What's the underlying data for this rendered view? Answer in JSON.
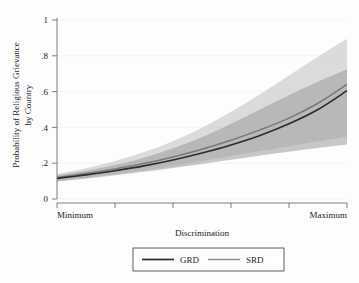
{
  "chart_data": {
    "type": "line",
    "title": "",
    "xlabel": "Discrimination",
    "ylabel": "Probability of Religious Grievance by Country",
    "ylim": [
      0,
      1
    ],
    "xlim": [
      0,
      1
    ],
    "grid": true,
    "y_ticks": [
      "0",
      ".2",
      ".4",
      ".6",
      ".8",
      "1"
    ],
    "y_tick_values": [
      0,
      0.2,
      0.4,
      0.6,
      0.8,
      1
    ],
    "x_ticks": [
      "Minimum",
      "",
      "",
      "",
      "",
      "Maximum"
    ],
    "x_tick_values": [
      0,
      0.2,
      0.4,
      0.6,
      0.8,
      1
    ],
    "legend_position": "below-axis",
    "x": [
      0,
      0.1,
      0.2,
      0.3,
      0.4,
      0.5,
      0.6,
      0.7,
      0.8,
      0.9,
      1
    ],
    "series": [
      {
        "name": "GRD",
        "color": "#2b2b2b",
        "values": [
          0.115,
          0.135,
          0.158,
          0.185,
          0.218,
          0.257,
          0.302,
          0.355,
          0.42,
          0.5,
          0.605
        ],
        "band_lower": [
          0.098,
          0.115,
          0.133,
          0.152,
          0.173,
          0.196,
          0.219,
          0.243,
          0.264,
          0.285,
          0.305
        ],
        "band_upper": [
          0.133,
          0.158,
          0.19,
          0.231,
          0.283,
          0.345,
          0.42,
          0.5,
          0.58,
          0.655,
          0.725
        ],
        "band_color": "#9b9b9b",
        "band_opacity": 0.55
      },
      {
        "name": "SRD",
        "color": "#787878",
        "values": [
          0.12,
          0.142,
          0.168,
          0.198,
          0.235,
          0.278,
          0.328,
          0.386,
          0.452,
          0.535,
          0.64
        ],
        "band_lower": [
          0.1,
          0.118,
          0.138,
          0.16,
          0.185,
          0.212,
          0.24,
          0.268,
          0.295,
          0.322,
          0.348
        ],
        "band_upper": [
          0.14,
          0.172,
          0.212,
          0.262,
          0.323,
          0.398,
          0.487,
          0.585,
          0.69,
          0.795,
          0.895
        ],
        "band_color": "#c4c4c4",
        "band_opacity": 0.6
      }
    ],
    "legend": [
      {
        "label": "GRD",
        "color": "#2b2b2b"
      },
      {
        "label": "SRD",
        "color": "#8a8a8a"
      }
    ]
  },
  "axes": {
    "y_label": "Probability of Religious Grievance by Country",
    "y_label_line1": "Probability of Religious Grievance",
    "y_label_line2": "by Country",
    "x_label": "Discrimination",
    "y_tick_labels": [
      "1",
      ".8",
      ".6",
      ".4",
      ".2",
      "0"
    ],
    "x_tick_label_min": "Minimum",
    "x_tick_label_max": "Maximum"
  },
  "legend": {
    "item_1_label": "GRD",
    "item_2_label": "SRD"
  },
  "colors": {
    "background": "#fdfdfd",
    "axis": "#6f6f6f",
    "grid": "#f2f2f4",
    "grd_line": "#2b2b2b",
    "srd_line": "#787878",
    "grd_band": "#9b9b9b",
    "srd_band": "#c4c4c4",
    "text": "#1c1c1c"
  }
}
